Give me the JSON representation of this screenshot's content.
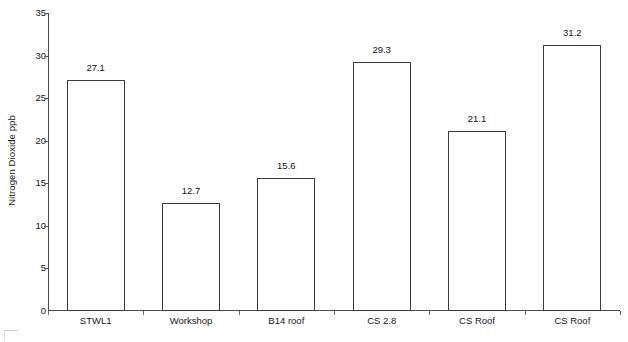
{
  "chart_data": {
    "type": "bar",
    "title": "",
    "subtitle": "",
    "xlabel": "",
    "ylabel": "Nitrogen Dioxide ppb",
    "categories": [
      "STWL1",
      "Workshop",
      "B14 roof",
      "CS 2.8",
      "CS Roof",
      "CS Roof"
    ],
    "values": [
      27.1,
      12.7,
      15.6,
      29.3,
      21.1,
      31.2
    ],
    "value_labels": [
      "27.1",
      "12.7",
      "15.6",
      "29.3",
      "21.1",
      "31.2"
    ],
    "ylim": [
      0,
      35
    ],
    "yticks": [
      0,
      5,
      10,
      15,
      20,
      25,
      30,
      35
    ],
    "ytick_labels": [
      "0",
      "5",
      "10",
      "15",
      "20",
      "25",
      "30",
      "35"
    ],
    "grid": false,
    "legend": false,
    "legend_position": "none",
    "bar_fill_color": "#ffffff",
    "bar_edge_color": "#3b3b3b",
    "axis_color": "#4a4a4a",
    "text_color": "#151515"
  }
}
